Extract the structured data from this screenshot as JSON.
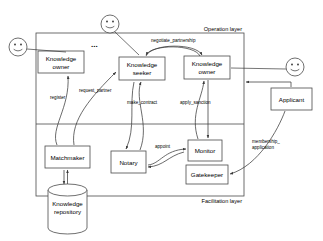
{
  "diagram": {
    "layers": {
      "operation": "Operation layer",
      "facilitation": "Facilitation layer"
    },
    "ellipsis": "...",
    "nodes": [
      {
        "id": "knowledge-owner-left",
        "line1": "Knowledge",
        "line2": "owner",
        "x": 38,
        "y": 51,
        "w": 46,
        "h": 22
      },
      {
        "id": "knowledge-seeker",
        "line1": "Knowledge",
        "line2": "seeker",
        "x": 119,
        "y": 57,
        "w": 46,
        "h": 23
      },
      {
        "id": "knowledge-owner-right",
        "line1": "Knowledge",
        "line2": "owner",
        "x": 184,
        "y": 56,
        "w": 46,
        "h": 23
      },
      {
        "id": "applicant",
        "line1": "Applicant",
        "line2": "",
        "x": 271,
        "y": 88,
        "w": 41,
        "h": 22
      },
      {
        "id": "matchmaker",
        "line1": "Matchmaker",
        "line2": "",
        "x": 45,
        "y": 146,
        "w": 45,
        "h": 22
      },
      {
        "id": "notary",
        "line1": "Notary",
        "line2": "",
        "x": 111,
        "y": 151,
        "w": 35,
        "h": 22
      },
      {
        "id": "monitor",
        "line1": "Monitor",
        "line2": "",
        "x": 188,
        "y": 140,
        "w": 34,
        "h": 21
      },
      {
        "id": "gatekeeper",
        "line1": "Gatekeeper",
        "line2": "",
        "x": 186,
        "y": 165,
        "w": 42,
        "h": 19
      }
    ],
    "repository": {
      "id": "knowledge-repository",
      "line1": "Knowledge",
      "line2": "repository"
    },
    "edge_labels": [
      {
        "id": "negotiate-partnership",
        "text": "negotiate_partnership"
      },
      {
        "id": "register",
        "text": "register"
      },
      {
        "id": "request-partner",
        "text": "request_partner"
      },
      {
        "id": "make-contract",
        "text": "make_contract"
      },
      {
        "id": "apply-sanction",
        "text": "apply_sanction"
      },
      {
        "id": "appoint",
        "text": "appoint"
      },
      {
        "id": "membership-line1",
        "text": "membership_"
      },
      {
        "id": "membership-line2",
        "text": "application"
      }
    ],
    "actors": [
      {
        "id": "actor-left",
        "cx": 18,
        "cy": 47
      },
      {
        "id": "actor-top",
        "cx": 110,
        "cy": 24
      },
      {
        "id": "actor-right",
        "cx": 295,
        "cy": 67
      }
    ],
    "colors": {
      "stroke": "#4a4a4a",
      "edge": "#3a3a3a",
      "background": "#ffffff",
      "text": "#000000"
    }
  }
}
